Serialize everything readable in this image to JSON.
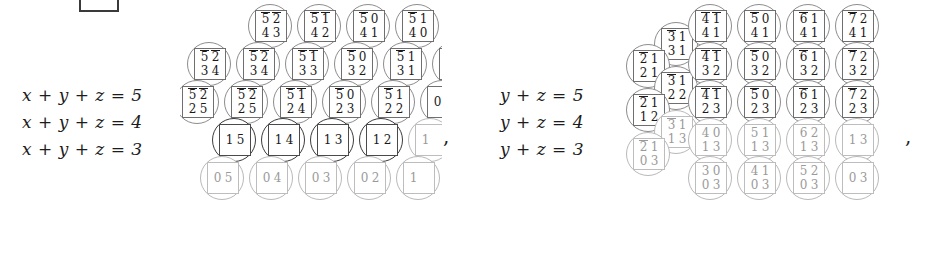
{
  "figure": {
    "background": "#ffffff",
    "ink": "#1a1a1a",
    "faint_ink": "#9a9a9a",
    "separator": ","
  },
  "left_panel": {
    "name": "x-y-z panel",
    "equations": [
      {
        "lhs": "x",
        "op1": "+",
        "mid": "y",
        "op2": "+",
        "rhs": "z",
        "eq": "=",
        "value": "5"
      },
      {
        "lhs": "x",
        "op1": "+",
        "mid": "y",
        "op2": "+",
        "rhs": "z",
        "eq": "=",
        "value": "4"
      },
      {
        "lhs": "x",
        "op1": "+",
        "mid": "y",
        "op2": "+",
        "rhs": "z",
        "eq": "=",
        "value": "3"
      }
    ],
    "equation_strings": [
      "x + y + z = 5",
      "x + y + z = 4",
      "x + y + z = 3"
    ],
    "rows": [
      {
        "row": 0,
        "cells": [
          {
            "top": [
              "5",
              "2"
            ],
            "bars": [
              true,
              true
            ],
            "bottom": [
              "4",
              "3"
            ],
            "style": "normal"
          },
          {
            "top": [
              "5",
              "1"
            ],
            "bars": [
              true,
              true
            ],
            "bottom": [
              "4",
              "2"
            ],
            "style": "normal"
          },
          {
            "top": [
              "5",
              "0"
            ],
            "bars": [
              true,
              false
            ],
            "bottom": [
              "4",
              "1"
            ],
            "style": "normal"
          },
          {
            "top": [
              "5",
              "1"
            ],
            "bars": [
              true,
              false
            ],
            "bottom": [
              "4",
              "0"
            ],
            "style": "normal"
          }
        ]
      },
      {
        "row": 1,
        "cells": [
          {
            "top": [
              "5",
              "2"
            ],
            "bars": [
              true,
              true
            ],
            "bottom": [
              "3",
              "4"
            ],
            "style": "normal"
          },
          {
            "top": [
              "5",
              "1"
            ],
            "bars": [
              true,
              true
            ],
            "bottom": [
              "3",
              "3"
            ],
            "style": "normal"
          },
          {
            "top": [
              "5",
              "0"
            ],
            "bars": [
              true,
              false
            ],
            "bottom": [
              "3",
              "2"
            ],
            "style": "normal"
          },
          {
            "top": [
              "5",
              "1"
            ],
            "bars": [
              true,
              false
            ],
            "bottom": [
              "3",
              "1"
            ],
            "style": "normal"
          }
        ]
      },
      {
        "row": 2,
        "cells": [
          {
            "top": [
              "5",
              "2"
            ],
            "bars": [
              true,
              true
            ],
            "bottom": [
              "2",
              "5"
            ],
            "style": "normal"
          },
          {
            "top": [
              "5",
              "1"
            ],
            "bars": [
              true,
              true
            ],
            "bottom": [
              "2",
              "4"
            ],
            "style": "normal"
          },
          {
            "top": [
              "5",
              "0"
            ],
            "bars": [
              true,
              false
            ],
            "bottom": [
              "2",
              "3"
            ],
            "style": "normal"
          },
          {
            "top": [
              "5",
              "1"
            ],
            "bars": [
              true,
              false
            ],
            "bottom": [
              "2",
              "2"
            ],
            "style": "normal"
          }
        ]
      },
      {
        "row": 3,
        "cells": [
          {
            "top": [
              "",
              ""
            ],
            "bars": [
              false,
              false
            ],
            "bottom": [
              "1",
              "5"
            ],
            "style": "dark"
          },
          {
            "top": [
              "",
              ""
            ],
            "bars": [
              false,
              false
            ],
            "bottom": [
              "1",
              "4"
            ],
            "style": "dark"
          },
          {
            "top": [
              "",
              ""
            ],
            "bars": [
              false,
              false
            ],
            "bottom": [
              "1",
              "3"
            ],
            "style": "dark"
          },
          {
            "top": [
              "",
              ""
            ],
            "bars": [
              false,
              false
            ],
            "bottom": [
              "1",
              "2"
            ],
            "style": "dark"
          }
        ]
      },
      {
        "row": 4,
        "cells": [
          {
            "top": [
              "",
              ""
            ],
            "bars": [
              false,
              false
            ],
            "bottom": [
              "0",
              "5"
            ],
            "style": "faint"
          },
          {
            "top": [
              "",
              ""
            ],
            "bars": [
              false,
              false
            ],
            "bottom": [
              "0",
              "4"
            ],
            "style": "faint"
          },
          {
            "top": [
              "",
              ""
            ],
            "bars": [
              false,
              false
            ],
            "bottom": [
              "0",
              "3"
            ],
            "style": "faint"
          },
          {
            "top": [
              "",
              ""
            ],
            "bars": [
              false,
              false
            ],
            "bottom": [
              "0",
              "2"
            ],
            "style": "faint"
          }
        ]
      }
    ],
    "edge_fragments": [
      {
        "digit": "0",
        "row": 1
      },
      {
        "digit": "0",
        "row": 2
      },
      {
        "digit": "1",
        "row": 3
      },
      {
        "digit": "1",
        "row": 4
      }
    ],
    "left_fragments": [
      {
        "top": [
          "5",
          "2"
        ],
        "bars": [
          true,
          true
        ],
        "bottom": [
          "3",
          "4"
        ]
      },
      {
        "top": [
          "5",
          "2"
        ],
        "bars": [
          true,
          true
        ],
        "bottom": [
          "2",
          "5"
        ]
      }
    ]
  },
  "right_panel": {
    "name": "y-z panel",
    "equations": [
      {
        "lhs": "y",
        "op1": "+",
        "rhs": "z",
        "eq": "=",
        "value": "5"
      },
      {
        "lhs": "y",
        "op1": "+",
        "rhs": "z",
        "eq": "=",
        "value": "4"
      },
      {
        "lhs": "y",
        "op1": "+",
        "rhs": "z",
        "eq": "=",
        "value": "3"
      }
    ],
    "equation_strings": [
      "y + z = 5",
      "y + z = 4",
      "y + z = 3"
    ],
    "rows": [
      {
        "row": 0,
        "cells": [
          {
            "top": [
              "4",
              "1"
            ],
            "bars": [
              true,
              true
            ],
            "bottom": [
              "4",
              "1"
            ],
            "style": "normal"
          },
          {
            "top": [
              "5",
              "0"
            ],
            "bars": [
              true,
              false
            ],
            "bottom": [
              "4",
              "1"
            ],
            "style": "normal"
          },
          {
            "top": [
              "6",
              "1"
            ],
            "bars": [
              true,
              false
            ],
            "bottom": [
              "4",
              "1"
            ],
            "style": "normal"
          },
          {
            "top": [
              "7",
              "2"
            ],
            "bars": [
              true,
              false
            ],
            "bottom": [
              "4",
              "1"
            ],
            "style": "normal"
          }
        ]
      },
      {
        "row": 1,
        "cells": [
          {
            "top": [
              "4",
              "1"
            ],
            "bars": [
              true,
              true
            ],
            "bottom": [
              "3",
              "2"
            ],
            "style": "normal"
          },
          {
            "top": [
              "5",
              "0"
            ],
            "bars": [
              true,
              false
            ],
            "bottom": [
              "3",
              "2"
            ],
            "style": "normal"
          },
          {
            "top": [
              "6",
              "1"
            ],
            "bars": [
              true,
              false
            ],
            "bottom": [
              "3",
              "2"
            ],
            "style": "normal"
          },
          {
            "top": [
              "7",
              "2"
            ],
            "bars": [
              true,
              false
            ],
            "bottom": [
              "3",
              "2"
            ],
            "style": "normal"
          }
        ]
      },
      {
        "row": 2,
        "cells": [
          {
            "top": [
              "4",
              "1"
            ],
            "bars": [
              true,
              true
            ],
            "bottom": [
              "2",
              "3"
            ],
            "style": "normal"
          },
          {
            "top": [
              "5",
              "0"
            ],
            "bars": [
              true,
              false
            ],
            "bottom": [
              "2",
              "3"
            ],
            "style": "normal"
          },
          {
            "top": [
              "6",
              "1"
            ],
            "bars": [
              true,
              false
            ],
            "bottom": [
              "2",
              "3"
            ],
            "style": "normal"
          },
          {
            "top": [
              "7",
              "2"
            ],
            "bars": [
              true,
              false
            ],
            "bottom": [
              "2",
              "3"
            ],
            "style": "normal"
          }
        ]
      },
      {
        "row": 3,
        "cells": [
          {
            "top": [
              "4",
              "0"
            ],
            "bars": [
              false,
              false
            ],
            "bottom": [
              "1",
              "3"
            ],
            "style": "faint"
          },
          {
            "top": [
              "5",
              "1"
            ],
            "bars": [
              false,
              false
            ],
            "bottom": [
              "1",
              "3"
            ],
            "style": "faint"
          },
          {
            "top": [
              "6",
              "2"
            ],
            "bars": [
              false,
              false
            ],
            "bottom": [
              "1",
              "3"
            ],
            "style": "faint"
          },
          {
            "top": [
              "",
              ""
            ],
            "bars": [
              false,
              false
            ],
            "bottom": [
              "1",
              "3"
            ],
            "style": "faint"
          }
        ]
      },
      {
        "row": 4,
        "cells": [
          {
            "top": [
              "3",
              "0"
            ],
            "bars": [
              false,
              false
            ],
            "bottom": [
              "0",
              "3"
            ],
            "style": "faint"
          },
          {
            "top": [
              "4",
              "1"
            ],
            "bars": [
              false,
              false
            ],
            "bottom": [
              "0",
              "3"
            ],
            "style": "faint"
          },
          {
            "top": [
              "5",
              "2"
            ],
            "bars": [
              false,
              false
            ],
            "bottom": [
              "0",
              "3"
            ],
            "style": "faint"
          },
          {
            "top": [
              "",
              ""
            ],
            "bars": [
              false,
              false
            ],
            "bottom": [
              "0",
              "3"
            ],
            "style": "faint"
          }
        ]
      }
    ],
    "staircase_cells": [
      {
        "top": [
          "3",
          "1"
        ],
        "bars": [
          true,
          false
        ],
        "bottom": [
          "3",
          "1"
        ],
        "step": 0
      },
      {
        "top": [
          "2",
          "1"
        ],
        "bars": [
          true,
          false
        ],
        "bottom": [
          "2",
          "1"
        ],
        "step": 1
      },
      {
        "top": [
          "3",
          "1"
        ],
        "bars": [
          true,
          false
        ],
        "bottom": [
          "2",
          "2"
        ],
        "step": 2
      },
      {
        "top": [
          "2",
          "1"
        ],
        "bars": [
          true,
          false
        ],
        "bottom": [
          "1",
          "2"
        ],
        "step": 3
      },
      {
        "top": [
          "3",
          "1"
        ],
        "bars": [
          true,
          false
        ],
        "bottom": [
          "1",
          "3"
        ],
        "step": 4
      },
      {
        "top": [
          "2",
          "1"
        ],
        "bars": [
          true,
          false
        ],
        "bottom": [
          "0",
          "3"
        ],
        "step": 5
      }
    ]
  }
}
